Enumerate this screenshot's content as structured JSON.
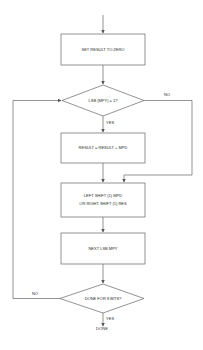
{
  "flowchart": {
    "nodes": [
      {
        "id": "set_result",
        "type": "process",
        "lines": [
          "SET RESULT TO ZERO"
        ]
      },
      {
        "id": "lsb_check",
        "type": "decision",
        "lines": [
          "LSB (MPY) = 1?"
        ]
      },
      {
        "id": "add",
        "type": "process",
        "lines": [
          "RESULT = RESULT + MPD"
        ]
      },
      {
        "id": "shift",
        "type": "process",
        "lines": [
          "LEFT SHIFT (1) MPD",
          "OR RIGHT SHIFT (1) RES"
        ]
      },
      {
        "id": "next_lsb",
        "type": "process",
        "lines": [
          "NEXT LSB MPY"
        ]
      },
      {
        "id": "done_check",
        "type": "decision",
        "lines": [
          "DONE FOR 8 BITS?"
        ]
      }
    ],
    "edge_labels": {
      "lsb_no": "NO",
      "lsb_yes": "YES",
      "done_no": "NO",
      "done_yes": "YES"
    },
    "terminal": "DONE"
  },
  "colors": {
    "line": "#555555",
    "box_border": "#666666",
    "background": "#ffffff"
  }
}
